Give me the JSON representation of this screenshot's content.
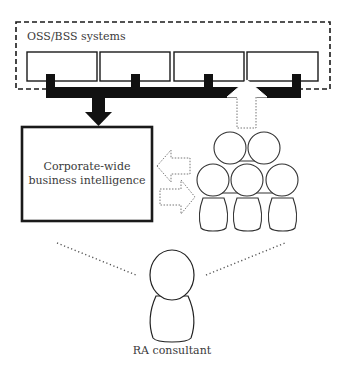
{
  "diagram": {
    "nodes": {
      "oss_bss": {
        "label": "OSS/BSS systems",
        "system_count": 4
      },
      "business_intelligence": {
        "line1": "Corporate-wide",
        "line2": "business intelligence"
      },
      "team": {
        "people_count": 5
      },
      "consultant": {
        "label": "RA consultant"
      }
    },
    "edges": [
      {
        "from": "oss_bss",
        "to": "business_intelligence",
        "style": "solid-thick"
      },
      {
        "from": "team",
        "to": "oss_bss",
        "style": "dotted"
      },
      {
        "from": "team",
        "to": "business_intelligence",
        "style": "dotted"
      },
      {
        "from": "business_intelligence",
        "to": "team",
        "style": "dotted"
      },
      {
        "from": "consultant",
        "to": "business_intelligence",
        "style": "dotted-line"
      },
      {
        "from": "consultant",
        "to": "team",
        "style": "dotted-line"
      }
    ],
    "colors": {
      "stroke": "#1a1a1a",
      "fill_dark": "#111111",
      "text": "#3a3a3a",
      "dotted": "#777777"
    }
  }
}
